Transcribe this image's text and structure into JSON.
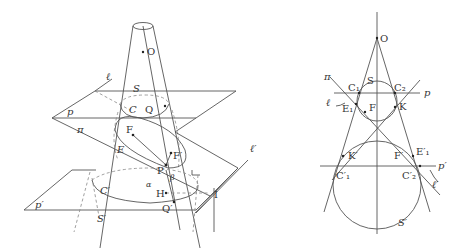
{
  "left_figure": {
    "description": "3D double cone cut by plane pi, with planes p and p'",
    "labels": {
      "O": "O",
      "ell": "ℓ",
      "S": "S",
      "p": "p",
      "C": "C",
      "Q": "Q",
      "pi": "π",
      "F": "F",
      "E": "E",
      "F_prime": "F′",
      "P": "P",
      "beta": "β",
      "alpha": "α",
      "C_prime": "C′",
      "H": "H",
      "I": "I",
      "p_prime": "p′",
      "Q_prime": "Q′",
      "S_prime": "S′",
      "ell_prime": "ℓ′"
    }
  },
  "right_figure": {
    "description": "Cross-section view with spheres S and S' inscribed in cone",
    "labels": {
      "O": "O",
      "pi": "π",
      "S": "S",
      "C1": "C₁",
      "C2": "C₂",
      "p": "p",
      "ell": "ℓ",
      "E1": "E₁",
      "F": "F",
      "K": "K",
      "K_prime": "K′",
      "F_prime": "F′",
      "E1_prime": "E′₁",
      "p_prime": "p′",
      "C1_prime": "C′₁",
      "C2_prime": "C′₂",
      "ell_prime": "ℓ′",
      "S_prime": "S′"
    }
  }
}
